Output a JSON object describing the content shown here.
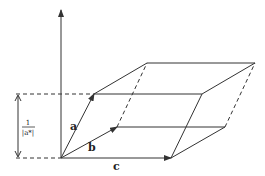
{
  "diagram": {
    "colors": {
      "line": "#333333",
      "background": "#ffffff"
    },
    "vectors": [
      {
        "name": "a",
        "label": "a"
      },
      {
        "name": "b",
        "label": "b"
      },
      {
        "name": "c",
        "label": "c"
      }
    ],
    "height_label": {
      "numerator": "1",
      "denominator": "|a*|"
    }
  }
}
